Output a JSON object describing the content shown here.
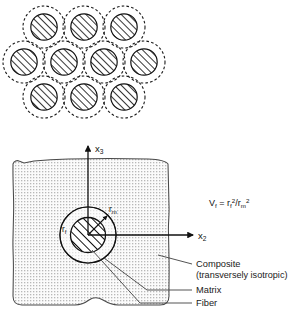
{
  "figure": {
    "top_diagram": {
      "name": "hexagonal-fiber-packing-array",
      "rows": [
        {
          "count": 3,
          "cx": [
            44,
            84,
            124
          ],
          "cy": 27
        },
        {
          "count": 4,
          "cx": [
            24,
            64,
            104,
            144
          ],
          "cy": 62
        },
        {
          "count": 3,
          "cx": [
            44,
            84,
            124
          ],
          "cy": 97
        }
      ],
      "outer_radius": 21,
      "inner_radius": 13.2,
      "outer_style": "dashed",
      "inner_style": "hatched"
    },
    "bottom_diagram": {
      "name": "rve-composite-cylinder-model",
      "axes": {
        "vertical_label": "x",
        "vertical_subscript": "3",
        "horizontal_label": "x",
        "horizontal_subscript": "2"
      },
      "radii": [
        {
          "label": "r",
          "subscript": "f",
          "target": "fiber"
        },
        {
          "label": "r",
          "subscript": "m",
          "target": "matrix"
        }
      ],
      "formula": {
        "lhs": "V",
        "lhs_sub": "f",
        "eq": "=",
        "num": "r",
        "num_sub": "f",
        "num_sup": "2",
        "slash": "/",
        "den": "r",
        "den_sub": "m",
        "den_sup": "2"
      },
      "callouts": [
        {
          "id": "composite",
          "line1": "Composite",
          "line2": "(transversely isotropic)"
        },
        {
          "id": "matrix",
          "line1": "Matrix",
          "line2": ""
        },
        {
          "id": "fiber",
          "line1": "Fiber",
          "line2": ""
        }
      ]
    },
    "colors": {
      "stroke": "#1a1a1a",
      "matrix_fill": "#f2f2f2",
      "hatch": "#111111",
      "background": "#ffffff"
    }
  }
}
